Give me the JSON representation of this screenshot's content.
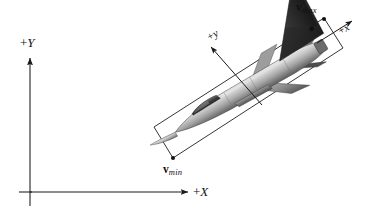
{
  "figure": {
    "background_color": "#ffffff",
    "line_color": "#1a1a1a",
    "box_color": "#2b2b2b"
  },
  "world_axes": {
    "x_axis": {
      "label_sign": "+",
      "label_letter": "X",
      "name": "world-x-axis"
    },
    "y_axis": {
      "label_sign": "+",
      "label_letter": "Y",
      "name": "world-y-axis"
    }
  },
  "local_axes": {
    "x_axis": {
      "label_sign": "+",
      "label_letter": "x",
      "rotation_deg": -30
    },
    "y_axis": {
      "label_sign": "+",
      "label_letter": "y",
      "rotation_deg": -30
    }
  },
  "markers": {
    "min": {
      "symbol": "v",
      "subscript": "min"
    },
    "max": {
      "symbol": "v",
      "subscript": "max"
    }
  },
  "bounding_box": {
    "rotation_deg": -30,
    "corners": [
      [
        154,
        127
      ],
      [
        173,
        158
      ],
      [
        343,
        48
      ],
      [
        324,
        18
      ]
    ]
  },
  "aircraft": {
    "name": "fighter-jet",
    "heading_deg": -30,
    "body_light": "#c9c9c9",
    "body_mid": "#9a9a9a",
    "body_dark": "#5a5a5a",
    "tail_dark": "#2e2e2e",
    "canopy": "#3c3c3c"
  }
}
